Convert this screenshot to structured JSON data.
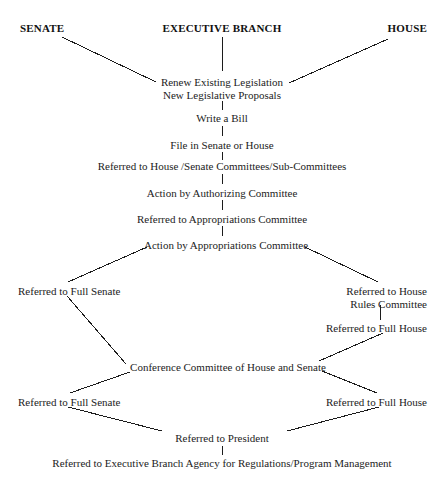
{
  "diagram": {
    "type": "flowchart",
    "canvas": {
      "width": 446,
      "height": 482
    },
    "colors": {
      "background": "#ffffff",
      "text": "#1c1c1c",
      "heading_text": "#111111",
      "edge": "#1c1c1c"
    },
    "headings": [
      {
        "id": "senate-heading",
        "label": "SENATE",
        "x": 20,
        "y": 22,
        "align": "left"
      },
      {
        "id": "executive-branch-heading",
        "label": "EXECUTIVE BRANCH",
        "x": 222,
        "y": 22,
        "align": "center"
      },
      {
        "id": "house-heading",
        "label": "HOUSE",
        "x": 427,
        "y": 22,
        "align": "right"
      }
    ],
    "nodes": [
      {
        "id": "renew-existing-legislation",
        "label": "Renew Existing Legislation",
        "label2": "New Legislative Proposals",
        "x": 222,
        "y": 76,
        "align": "center"
      },
      {
        "id": "write-a-bill",
        "label": "Write a Bill",
        "x": 222,
        "y": 112,
        "align": "center"
      },
      {
        "id": "file-in-senate-or-house",
        "label": "File in Senate or House",
        "x": 222,
        "y": 139,
        "align": "center"
      },
      {
        "id": "referred-to-house-senate-committees",
        "label": "Referred to House /Senate Committees/Sub-Committees",
        "x": 222,
        "y": 160,
        "align": "center"
      },
      {
        "id": "action-by-authorizing-committee",
        "label": "Action by Authorizing Committee",
        "x": 222,
        "y": 187,
        "align": "center"
      },
      {
        "id": "referred-to-appropriations-committee",
        "label": "Referred to Appropriations Committee",
        "x": 222,
        "y": 213,
        "align": "center"
      },
      {
        "id": "action-by-appropriations-committee",
        "label": "Action by Appropriations Committee",
        "x": 226,
        "y": 239,
        "align": "center"
      },
      {
        "id": "referred-to-full-senate-upper",
        "label": "Referred to Full Senate",
        "x": 18,
        "y": 285,
        "align": "left"
      },
      {
        "id": "referred-to-house-rules-committee",
        "label": "Referred to House",
        "label2": "Rules Committee",
        "x": 427,
        "y": 285,
        "align": "right"
      },
      {
        "id": "referred-to-full-house-upper",
        "label": "Referred to Full House",
        "x": 427,
        "y": 322,
        "align": "right"
      },
      {
        "id": "conference-committee",
        "label": "Conference Committee of House and Senate",
        "x": 228,
        "y": 361,
        "align": "center"
      },
      {
        "id": "referred-to-full-senate-lower",
        "label": "Referred to Full Senate",
        "x": 18,
        "y": 396,
        "align": "left"
      },
      {
        "id": "referred-to-full-house-lower",
        "label": "Referred to Full House",
        "x": 427,
        "y": 396,
        "align": "right"
      },
      {
        "id": "referred-to-president",
        "label": "Referred to President",
        "x": 222,
        "y": 432,
        "align": "center"
      },
      {
        "id": "referred-to-executive-branch-agency",
        "label": "Referred to Executive Branch Agency for Regulations/Program Management",
        "x": 222,
        "y": 457,
        "align": "center"
      }
    ],
    "edges": [
      {
        "id": "edge-senate-to-renew",
        "x1": 62,
        "y1": 37,
        "x2": 156,
        "y2": 82
      },
      {
        "id": "edge-house-to-renew",
        "x1": 388,
        "y1": 39,
        "x2": 289,
        "y2": 83
      },
      {
        "id": "edge-executive-to-renew",
        "x1": 222,
        "y1": 37,
        "x2": 222,
        "y2": 71
      },
      {
        "id": "edge-renew-to-write-bill",
        "x1": 222,
        "y1": 101,
        "x2": 222,
        "y2": 110
      },
      {
        "id": "edge-write-bill-to-file",
        "x1": 222,
        "y1": 126,
        "x2": 222,
        "y2": 136
      },
      {
        "id": "edge-file-to-committees",
        "x1": 222,
        "y1": 152,
        "x2": 222,
        "y2": 160
      },
      {
        "id": "edge-committees-to-authorizing",
        "x1": 222,
        "y1": 174,
        "x2": 222,
        "y2": 184
      },
      {
        "id": "edge-authorizing-to-appropriations",
        "x1": 222,
        "y1": 200,
        "x2": 222,
        "y2": 210
      },
      {
        "id": "edge-appropriations-to-action",
        "x1": 222,
        "y1": 226,
        "x2": 222,
        "y2": 236
      },
      {
        "id": "edge-action-to-full-senate",
        "x1": 147,
        "y1": 247,
        "x2": 68,
        "y2": 282
      },
      {
        "id": "edge-action-to-house-rules",
        "x1": 305,
        "y1": 247,
        "x2": 378,
        "y2": 282
      },
      {
        "id": "edge-house-rules-to-full-house",
        "x1": 380,
        "y1": 305,
        "x2": 380,
        "y2": 320
      },
      {
        "id": "edge-full-senate-to-conference",
        "x1": 67,
        "y1": 296,
        "x2": 126,
        "y2": 364
      },
      {
        "id": "edge-full-house-to-conference",
        "x1": 383,
        "y1": 333,
        "x2": 319,
        "y2": 361
      },
      {
        "id": "edge-conference-to-full-senate",
        "x1": 130,
        "y1": 372,
        "x2": 70,
        "y2": 393
      },
      {
        "id": "edge-conference-to-full-house",
        "x1": 322,
        "y1": 371,
        "x2": 377,
        "y2": 393
      },
      {
        "id": "edge-full-senate-to-president",
        "x1": 68,
        "y1": 407,
        "x2": 162,
        "y2": 431
      },
      {
        "id": "edge-full-house-to-president",
        "x1": 379,
        "y1": 407,
        "x2": 287,
        "y2": 431
      },
      {
        "id": "edge-president-to-agency",
        "x1": 222,
        "y1": 446,
        "x2": 222,
        "y2": 455
      }
    ]
  }
}
